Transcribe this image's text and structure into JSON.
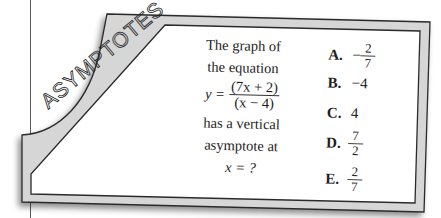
{
  "card": {
    "banner": "ASYMPTOTES",
    "colors": {
      "frame": "#d6d6d6",
      "border": "#2a2a2a",
      "page": "#ffffff",
      "margin_line": "#5a5a5a"
    }
  },
  "question": {
    "line1": "The graph of",
    "line2": "the equation",
    "eq_var": "y =",
    "eq_num": "(7x + 2)",
    "eq_den": "(x − 4)",
    "line3": "has a vertical",
    "line4": "asymptote at",
    "line5": "x = ?"
  },
  "answers": [
    {
      "letter": "A.",
      "sign": "−",
      "num": "2",
      "den": "7"
    },
    {
      "letter": "B.",
      "value": "−4"
    },
    {
      "letter": "C.",
      "value": "4"
    },
    {
      "letter": "D.",
      "num": "7",
      "den": "2"
    },
    {
      "letter": "E.",
      "num": "2",
      "den": "7"
    }
  ]
}
